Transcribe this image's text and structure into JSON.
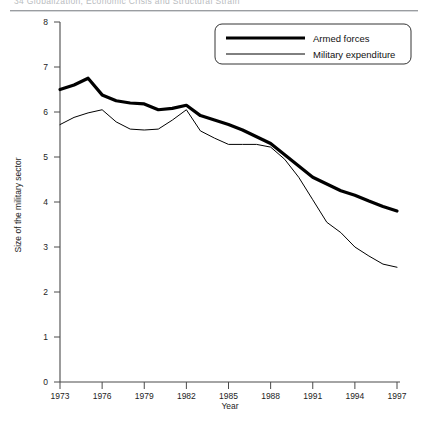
{
  "header": {
    "running_text": "34   Globalization, Economic Crisis and Structural Strain"
  },
  "chart_data": {
    "type": "line",
    "title": "",
    "xlabel": "Year",
    "ylabel": "Size of the military sector",
    "xlim": [
      1973,
      1997
    ],
    "ylim": [
      0,
      8
    ],
    "grid": false,
    "legend_position": "top-right",
    "x": [
      1973,
      1974,
      1975,
      1976,
      1977,
      1978,
      1979,
      1980,
      1981,
      1982,
      1983,
      1984,
      1985,
      1986,
      1987,
      1988,
      1989,
      1990,
      1991,
      1992,
      1993,
      1994,
      1995,
      1996,
      1997
    ],
    "xticks": [
      1973,
      1976,
      1979,
      1982,
      1985,
      1988,
      1991,
      1994,
      1997
    ],
    "xtick_labels": [
      "1973",
      "1976",
      "1979",
      "1982",
      "1985",
      "1988",
      "1991",
      "1994",
      "1997"
    ],
    "yticks": [
      0,
      1,
      2,
      3,
      4,
      5,
      6,
      7,
      8
    ],
    "ytick_labels": [
      "0",
      "1",
      "2",
      "3",
      "4",
      "5",
      "6",
      "7",
      "8"
    ],
    "series": [
      {
        "name": "Armed forces",
        "style": "thick",
        "color": "#000000",
        "width": 3.2,
        "values": [
          6.5,
          6.6,
          6.75,
          6.38,
          6.25,
          6.2,
          6.18,
          6.05,
          6.08,
          6.15,
          5.92,
          5.82,
          5.72,
          5.6,
          5.45,
          5.3,
          5.05,
          4.8,
          4.55,
          4.4,
          4.25,
          4.15,
          4.02,
          3.9,
          3.8
        ]
      },
      {
        "name": "Military expenditure",
        "style": "thin",
        "color": "#000000",
        "width": 1.0,
        "values": [
          5.72,
          5.88,
          5.98,
          6.05,
          5.78,
          5.62,
          5.6,
          5.62,
          5.82,
          6.05,
          5.58,
          5.42,
          5.28,
          5.28,
          5.28,
          5.22,
          4.95,
          4.55,
          4.05,
          3.55,
          3.32,
          3.0,
          2.8,
          2.62,
          2.55
        ]
      }
    ]
  },
  "legend": {
    "entries": [
      {
        "label": "Armed forces"
      },
      {
        "label": "Military expenditure"
      }
    ]
  }
}
